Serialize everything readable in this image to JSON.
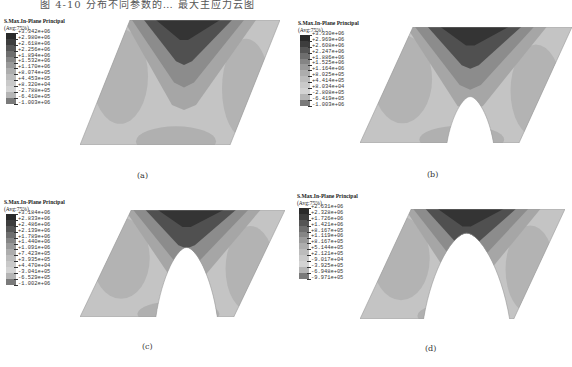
{
  "header_fragment": "图 4-10 分布不同参数的… 最大主应力云图",
  "legend_title": "S.Max.In-Plane Principal",
  "legend_subtitle": "(Avg:75%)",
  "colors": {
    "levels": [
      "#2a2a2a",
      "#3d3d3d",
      "#555555",
      "#6e6e6e",
      "#858585",
      "#9a9a9a",
      "#adadad",
      "#bcbcbc",
      "#c9c9c9",
      "#d3d3d3",
      "#b5b5b5",
      "#7a7a7a",
      "#3a3a3a"
    ],
    "background": "#ffffff"
  },
  "panels": [
    {
      "id": "a",
      "caption": "(a)",
      "notch": "none",
      "legend_values": [
        "+3.342e+06",
        "+2.980e+06",
        "+2.618e+06",
        "+2.256e+06",
        "+1.894e+06",
        "+1.532e+06",
        "+1.170e+06",
        "+8.074e+05",
        "+4.453e+05",
        "+8.320e+04",
        "-2.788e+05",
        "-6.410e+05",
        "-1.003e+06"
      ]
    },
    {
      "id": "b",
      "caption": "(b)",
      "notch": "small",
      "legend_values": [
        "+3.330e+06",
        "+2.969e+06",
        "+2.608e+06",
        "+2.247e+06",
        "+1.886e+06",
        "+1.525e+06",
        "+1.164e+06",
        "+8.025e+05",
        "+4.414e+05",
        "+8.034e+04",
        "-2.808e+05",
        "-6.419e+05",
        "-1.003e+06"
      ]
    },
    {
      "id": "c",
      "caption": "(c)",
      "notch": "medium",
      "legend_values": [
        "+3.184e+06",
        "+2.833e+06",
        "+2.486e+06",
        "+2.139e+06",
        "+1.789e+06",
        "+1.440e+06",
        "+1.091e+06",
        "+7.423e+05",
        "+3.935e+05",
        "+4.470e+04",
        "-3.041e+05",
        "-6.529e+05",
        "-1.002e+06"
      ]
    },
    {
      "id": "d",
      "caption": "(d)",
      "notch": "large",
      "legend_values": [
        "+2.631e+06",
        "+2.328e+06",
        "+1.726e+06",
        "+1.421e+06",
        "+8.167e+05",
        "+1.119e+06",
        "+8.167e+05",
        "+5.144e+05",
        "+2.121e+05",
        "-9.017e+04",
        "-3.925e+05",
        "-6.948e+05",
        "-9.971e+05"
      ]
    }
  ]
}
